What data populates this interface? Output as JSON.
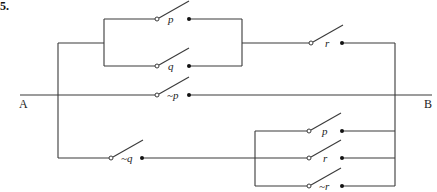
{
  "problem_number": "5.",
  "terminals": {
    "left": "A",
    "right": "B"
  },
  "switches": [
    {
      "id": "top-p",
      "label": "p",
      "x": 157,
      "y": 19
    },
    {
      "id": "top-q",
      "label": "q",
      "x": 157,
      "y": 66
    },
    {
      "id": "top-r",
      "label": "r",
      "x": 311,
      "y": 43
    },
    {
      "id": "mid-not-p",
      "label": "~p",
      "x": 157,
      "y": 95
    },
    {
      "id": "bottom-not-q",
      "label": "~q",
      "x": 111,
      "y": 158
    },
    {
      "id": "bottom-p",
      "label": "p",
      "x": 309,
      "y": 131
    },
    {
      "id": "bottom-r",
      "label": "r",
      "x": 309,
      "y": 158
    },
    {
      "id": "bottom-not-r",
      "label": "~r",
      "x": 309,
      "y": 186
    }
  ],
  "colors": {
    "wire": "#3a3a3a",
    "background": "#ffffff"
  }
}
